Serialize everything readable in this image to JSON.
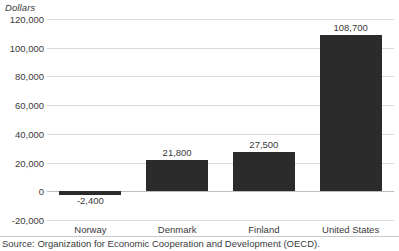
{
  "chart_data": {
    "type": "bar",
    "title": "",
    "subtitle": "",
    "xlabel": "",
    "ylabel": "Dollars",
    "categories": [
      "Norway",
      "Denmark",
      "Finland",
      "United States"
    ],
    "values": [
      -2400,
      21800,
      27500,
      108700
    ],
    "value_labels": [
      "-2,400",
      "21,800",
      "27,500",
      "108,700"
    ],
    "series": [
      {
        "name": "Dollars",
        "values": [
          -2400,
          21800,
          27500,
          108700
        ],
        "color": "#2b2b2b"
      }
    ],
    "ylim": [
      -20000,
      120000
    ],
    "ytick_step": 20000,
    "ytick_values": [
      120000,
      100000,
      80000,
      60000,
      40000,
      20000,
      0,
      -20000
    ],
    "ytick_labels": [
      "120,000",
      "100,000",
      "80,000",
      "60,000",
      "40,000",
      "20,000",
      "0",
      "-20,000"
    ],
    "grid": true,
    "grid_color": "#d9d9d9",
    "zero_line_color": "#bdbdbd",
    "legend": false,
    "legend_position": "none",
    "bar_color": "#2b2b2b",
    "background": "#ffffff",
    "annotations": []
  },
  "footer": {
    "source_note": "Source: Organization for Economic Cooperation and Development (OECD)."
  }
}
